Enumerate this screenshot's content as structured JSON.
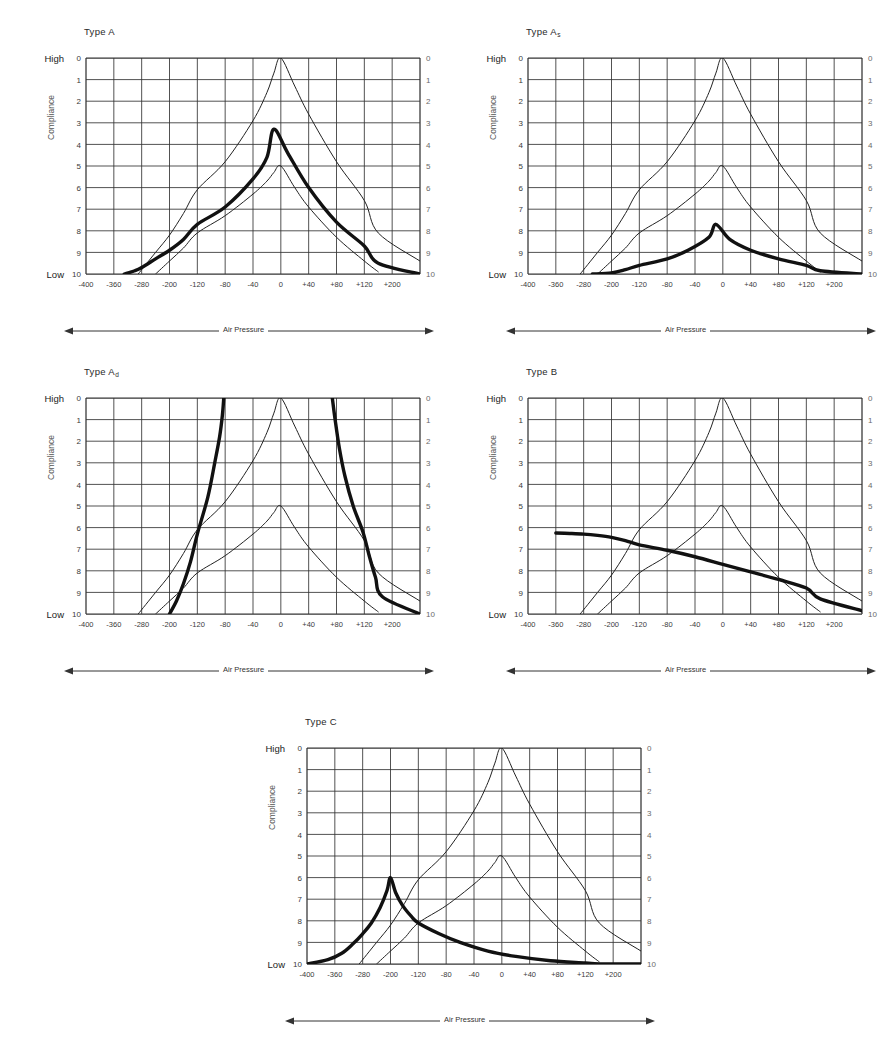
{
  "figure": {
    "kind": "tympanogram-panel-set",
    "panel_count": 5,
    "axis": {
      "y_title": "Compliance",
      "y_high_label": "High",
      "y_low_label": "Low",
      "y_ticks": [
        "0",
        "1",
        "2",
        "3",
        "4",
        "5",
        "6",
        "7",
        "8",
        "9",
        "10"
      ],
      "y_min": 0,
      "y_max": 10,
      "x_axis_title": "Air Pressure",
      "x_tick_labels": [
        "-400",
        "-360",
        "-280",
        "-200",
        "-120",
        "-80",
        "-40",
        "0",
        "+40",
        "+80",
        "+120",
        "+200"
      ],
      "x_tick_values": [
        -400,
        -360,
        -280,
        -200,
        -120,
        -80,
        -40,
        0,
        40,
        80,
        120,
        200
      ],
      "grid_columns": 12,
      "grid_rows": 10,
      "grid": "on",
      "legend": "none"
    },
    "colors": {
      "ink": "#1a1a1a",
      "grid": "#333333",
      "thin_curve": "#222222",
      "thick_curve": "#111111",
      "label": "#2a2a2a",
      "background": "#ffffff"
    }
  },
  "panels": [
    {
      "id": "type-a",
      "title": "Type A",
      "subscript": "",
      "y_title": "Compliance",
      "y_high_label": "High",
      "y_low_label": "Low",
      "x_axis_title": "Air Pressure"
    },
    {
      "id": "type-a-s",
      "title": "Type A",
      "subscript": "s",
      "y_title": "Compliance",
      "y_high_label": "High",
      "y_low_label": "Low",
      "x_axis_title": "Air Pressure"
    },
    {
      "id": "type-a-d",
      "title": "Type A",
      "subscript": "d",
      "y_title": "Compliance",
      "y_high_label": "High",
      "y_low_label": "Low",
      "x_axis_title": "Air Pressure"
    },
    {
      "id": "type-b",
      "title": "Type B",
      "subscript": "",
      "y_title": "Compliance",
      "y_high_label": "High",
      "y_low_label": "Low",
      "x_axis_title": "Air Pressure"
    },
    {
      "id": "type-c",
      "title": "Type C",
      "subscript": "",
      "y_title": "Compliance",
      "y_high_label": "High",
      "y_low_label": "Low",
      "x_axis_title": "Air Pressure"
    }
  ],
  "chart_data": [
    {
      "type": "line",
      "id": "type-a",
      "title": "Type A",
      "xlabel": "Air Pressure",
      "ylabel": "Compliance",
      "xlim": [
        -400,
        200
      ],
      "ylim": [
        0,
        10
      ],
      "y_inverted": true,
      "grid": true,
      "legend": null,
      "series": [
        {
          "name": "normal-envelope-upper",
          "style": "thin",
          "x": [
            -290,
            -240,
            -200,
            -160,
            -120,
            -80,
            -40,
            -20,
            -10,
            0,
            20,
            40,
            80,
            120,
            160,
            200
          ],
          "y": [
            10.0,
            9.0,
            8.2,
            7.2,
            6.1,
            4.8,
            2.9,
            1.6,
            0.7,
            0.0,
            1.3,
            2.6,
            4.8,
            6.6,
            8.1,
            9.4
          ]
        },
        {
          "name": "normal-envelope-lower",
          "style": "thin",
          "x": [
            -240,
            -200,
            -160,
            -120,
            -80,
            -40,
            -20,
            -10,
            0,
            20,
            40,
            80,
            120,
            160
          ],
          "y": [
            10.0,
            9.4,
            8.8,
            8.1,
            7.3,
            6.3,
            5.7,
            5.3,
            5.0,
            6.0,
            6.9,
            8.3,
            9.4,
            9.9
          ]
        },
        {
          "name": "patient-tympanogram",
          "style": "thick",
          "x": [
            -330,
            -300,
            -280,
            -240,
            -200,
            -160,
            -120,
            -80,
            -40,
            -20,
            -10,
            10,
            40,
            80,
            120,
            160,
            200
          ],
          "y": [
            10.0,
            9.85,
            9.7,
            9.3,
            8.9,
            8.4,
            7.7,
            6.9,
            5.6,
            4.6,
            3.3,
            4.4,
            6.0,
            7.6,
            8.7,
            9.5,
            10.0
          ]
        }
      ],
      "reading": {
        "peak_pressure": -10,
        "peak_compliance": 3.3,
        "classification": "Type A"
      }
    },
    {
      "type": "line",
      "id": "type-a-s",
      "title": "Type As",
      "xlabel": "Air Pressure",
      "ylabel": "Compliance",
      "xlim": [
        -400,
        200
      ],
      "ylim": [
        0,
        10
      ],
      "y_inverted": true,
      "grid": true,
      "legend": null,
      "series": [
        {
          "name": "normal-envelope-upper",
          "style": "thin",
          "x": [
            -290,
            -240,
            -200,
            -160,
            -120,
            -80,
            -40,
            -20,
            -10,
            0,
            20,
            40,
            80,
            120,
            160,
            200
          ],
          "y": [
            10.0,
            9.0,
            8.2,
            7.2,
            6.1,
            4.8,
            2.9,
            1.6,
            0.7,
            0.0,
            1.3,
            2.6,
            4.8,
            6.6,
            8.1,
            9.4
          ]
        },
        {
          "name": "normal-envelope-lower",
          "style": "thin",
          "x": [
            -240,
            -200,
            -160,
            -120,
            -80,
            -40,
            -20,
            -10,
            0,
            20,
            40,
            80,
            120,
            160
          ],
          "y": [
            10.0,
            9.4,
            8.8,
            8.1,
            7.3,
            6.3,
            5.7,
            5.3,
            5.0,
            6.0,
            6.9,
            8.3,
            9.4,
            9.9
          ]
        },
        {
          "name": "patient-tympanogram",
          "style": "thick",
          "x": [
            -255,
            -200,
            -160,
            -120,
            -80,
            -50,
            -20,
            -10,
            10,
            40,
            80,
            120,
            160,
            200
          ],
          "y": [
            10.0,
            9.95,
            9.8,
            9.6,
            9.3,
            8.9,
            8.3,
            7.7,
            8.4,
            8.9,
            9.3,
            9.6,
            9.85,
            10.0
          ]
        }
      ],
      "reading": {
        "peak_pressure": -10,
        "peak_compliance": 7.7,
        "classification": "Type As (shallow)"
      }
    },
    {
      "type": "line",
      "id": "type-a-d",
      "title": "Type Ad",
      "xlabel": "Air Pressure",
      "ylabel": "Compliance",
      "xlim": [
        -400,
        200
      ],
      "ylim": [
        0,
        10
      ],
      "y_inverted": true,
      "grid": true,
      "legend": null,
      "series": [
        {
          "name": "normal-envelope-upper",
          "style": "thin",
          "x": [
            -290,
            -240,
            -200,
            -160,
            -120,
            -80,
            -40,
            -20,
            -10,
            0,
            20,
            40,
            80,
            120,
            160,
            200
          ],
          "y": [
            10.0,
            9.0,
            8.2,
            7.2,
            6.1,
            4.8,
            2.9,
            1.6,
            0.7,
            0.0,
            1.3,
            2.6,
            4.8,
            6.6,
            8.1,
            9.4
          ]
        },
        {
          "name": "normal-envelope-lower",
          "style": "thin",
          "x": [
            -240,
            -200,
            -160,
            -120,
            -80,
            -40,
            -20,
            -10,
            0,
            20,
            40,
            80,
            120,
            160
          ],
          "y": [
            10.0,
            9.4,
            8.8,
            8.1,
            7.3,
            6.3,
            5.7,
            5.3,
            5.0,
            6.0,
            6.9,
            8.3,
            9.4,
            9.9
          ]
        },
        {
          "name": "patient-tympanogram-left-limb",
          "style": "thick",
          "x": [
            -200,
            -180,
            -160,
            -140,
            -120,
            -105,
            -95,
            -88,
            -84,
            -82
          ],
          "y": [
            10.0,
            9.4,
            8.6,
            7.6,
            6.3,
            4.6,
            3.0,
            1.8,
            0.8,
            0.0
          ]
        },
        {
          "name": "patient-tympanogram-right-limb",
          "style": "thick",
          "x": [
            74,
            78,
            84,
            92,
            104,
            118,
            134,
            152,
            172,
            200
          ],
          "y": [
            0.0,
            1.0,
            2.3,
            3.6,
            5.0,
            6.2,
            7.3,
            8.3,
            9.2,
            10.0
          ]
        }
      ],
      "reading": {
        "peak_pressure": -10,
        "peak_compliance": null,
        "classification": "Type Ad (hypermobile, off-scale peak)"
      }
    },
    {
      "type": "line",
      "id": "type-b",
      "title": "Type B",
      "xlabel": "Air Pressure",
      "ylabel": "Compliance",
      "xlim": [
        -400,
        200
      ],
      "ylim": [
        0,
        10
      ],
      "y_inverted": true,
      "grid": true,
      "legend": null,
      "series": [
        {
          "name": "normal-envelope-upper",
          "style": "thin",
          "x": [
            -290,
            -240,
            -200,
            -160,
            -120,
            -80,
            -40,
            -20,
            -10,
            0,
            20,
            40,
            80,
            120,
            160,
            200
          ],
          "y": [
            10.0,
            9.0,
            8.2,
            7.2,
            6.1,
            4.8,
            2.9,
            1.6,
            0.7,
            0.0,
            1.3,
            2.6,
            4.8,
            6.6,
            8.1,
            9.4
          ]
        },
        {
          "name": "normal-envelope-lower",
          "style": "thin",
          "x": [
            -240,
            -200,
            -160,
            -120,
            -80,
            -40,
            -20,
            -10,
            0,
            20,
            40,
            80,
            120,
            160
          ],
          "y": [
            10.0,
            9.4,
            8.8,
            8.1,
            7.3,
            6.3,
            5.7,
            5.3,
            5.0,
            6.0,
            6.9,
            8.3,
            9.4,
            9.9
          ]
        },
        {
          "name": "patient-tympanogram",
          "style": "thick",
          "x": [
            -360,
            -320,
            -280,
            -240,
            -200,
            -160,
            -120,
            -80,
            -40,
            0,
            40,
            80,
            120,
            160,
            200
          ],
          "y": [
            6.25,
            6.27,
            6.3,
            6.36,
            6.45,
            6.6,
            6.8,
            7.05,
            7.35,
            7.7,
            8.05,
            8.4,
            8.8,
            9.3,
            9.85
          ]
        }
      ],
      "reading": {
        "peak_pressure": null,
        "peak_compliance": null,
        "classification": "Type B (flat, no peak)"
      }
    },
    {
      "type": "line",
      "id": "type-c",
      "title": "Type C",
      "xlabel": "Air Pressure",
      "ylabel": "Compliance",
      "xlim": [
        -400,
        200
      ],
      "ylim": [
        0,
        10
      ],
      "y_inverted": true,
      "grid": true,
      "legend": null,
      "series": [
        {
          "name": "normal-envelope-upper",
          "style": "thin",
          "x": [
            -290,
            -240,
            -200,
            -160,
            -120,
            -80,
            -40,
            -20,
            -10,
            0,
            20,
            40,
            80,
            120,
            160,
            200
          ],
          "y": [
            10.0,
            9.0,
            8.2,
            7.2,
            6.1,
            4.8,
            2.9,
            1.6,
            0.7,
            0.0,
            1.3,
            2.6,
            4.8,
            6.6,
            8.1,
            9.4
          ]
        },
        {
          "name": "normal-envelope-lower",
          "style": "thin",
          "x": [
            -240,
            -200,
            -160,
            -120,
            -80,
            -40,
            -20,
            -10,
            0,
            20,
            40,
            80,
            120,
            160
          ],
          "y": [
            10.0,
            9.4,
            8.8,
            8.1,
            7.3,
            6.3,
            5.7,
            5.3,
            5.0,
            6.0,
            6.9,
            8.3,
            9.4,
            9.9
          ]
        },
        {
          "name": "patient-tympanogram",
          "style": "thick",
          "x": [
            -400,
            -370,
            -340,
            -310,
            -280,
            -255,
            -230,
            -210,
            -200,
            -185,
            -165,
            -140,
            -120,
            -90,
            -60,
            -20,
            20,
            70,
            120,
            160,
            200
          ],
          "y": [
            10.0,
            9.8,
            9.5,
            9.1,
            8.6,
            8.1,
            7.4,
            6.6,
            6.0,
            6.7,
            7.3,
            7.8,
            8.1,
            8.6,
            9.0,
            9.4,
            9.65,
            9.85,
            9.95,
            10.0,
            10.0
          ]
        }
      ],
      "reading": {
        "peak_pressure": -200,
        "peak_compliance": 6.0,
        "classification": "Type C (negative pressure peak)"
      }
    }
  ]
}
